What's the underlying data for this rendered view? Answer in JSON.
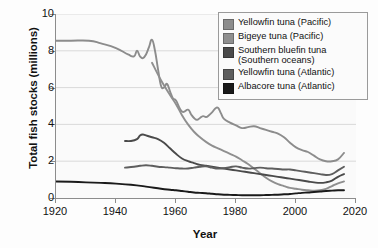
{
  "chart_data": {
    "type": "line",
    "title": "",
    "xlabel": "Year",
    "ylabel": "Total fish stocks (millions)",
    "xlim": [
      1920,
      2020
    ],
    "ylim": [
      0,
      10
    ],
    "xticks": [
      1920,
      1940,
      1960,
      1980,
      2000,
      2020
    ],
    "yticks": [
      0,
      2,
      4,
      6,
      8,
      10
    ],
    "grid": "horizontal",
    "legend_position": "top-right",
    "series": [
      {
        "name": "Yellowfin tuna (Pacific)",
        "color": "#8c8c8c",
        "x": [
          1920,
          1925,
          1931,
          1935,
          1940,
          1944,
          1946,
          1947,
          1948,
          1949,
          1950,
          1951,
          1952,
          1953,
          1954,
          1955,
          1956,
          1957,
          1958,
          1959,
          1960,
          1962,
          1964,
          1965,
          1966,
          1967,
          1968,
          1969,
          1970,
          1971,
          1972,
          1973,
          1974,
          1975,
          1976,
          1978,
          1980,
          1982,
          1984,
          1986,
          1988,
          1990,
          1992,
          1994,
          1996,
          1998,
          2000,
          2002,
          2004,
          2006,
          2008,
          2010,
          2012,
          2014,
          2016
        ],
        "y": [
          8.55,
          8.55,
          8.55,
          8.4,
          8.15,
          7.8,
          7.7,
          8.0,
          7.7,
          7.6,
          7.8,
          8.2,
          8.6,
          8.0,
          7.0,
          6.1,
          6.0,
          6.2,
          5.8,
          5.4,
          5.3,
          4.7,
          4.8,
          4.55,
          4.35,
          4.25,
          4.35,
          4.45,
          4.4,
          4.5,
          4.65,
          4.85,
          4.9,
          4.6,
          4.3,
          4.1,
          3.95,
          3.8,
          3.85,
          3.9,
          3.8,
          3.7,
          3.6,
          3.5,
          3.3,
          3.0,
          2.75,
          2.6,
          2.5,
          2.3,
          2.1,
          2.0,
          2.0,
          2.1,
          2.45
        ]
      },
      {
        "name": "Bigeye tuna (Pacific)",
        "color": "#8f8f8f",
        "x": [
          1952,
          1955,
          1958,
          1960,
          1962,
          1964,
          1966,
          1968,
          1970,
          1972,
          1974,
          1976,
          1978,
          1980,
          1982,
          1984,
          1986,
          1988,
          1990,
          1992,
          1994,
          1996,
          1998,
          2000,
          2002,
          2004,
          2006,
          2008,
          2010,
          2012,
          2014,
          2016
        ],
        "y": [
          7.35,
          6.4,
          5.6,
          5.1,
          4.5,
          4.0,
          3.6,
          3.3,
          3.05,
          2.85,
          2.7,
          2.55,
          2.4,
          2.25,
          2.05,
          1.85,
          1.6,
          1.35,
          1.1,
          0.9,
          0.75,
          0.65,
          0.55,
          0.5,
          0.45,
          0.42,
          0.4,
          0.42,
          0.5,
          0.65,
          0.8,
          0.9
        ]
      },
      {
        "name": "Southern bluefin tuna (Southern oceans)",
        "color": "#4a4a4a",
        "x": [
          1943,
          1945,
          1947,
          1948,
          1949,
          1950,
          1952,
          1954,
          1956,
          1958,
          1960,
          1962,
          1964,
          1966,
          1968,
          1970,
          1972,
          1974,
          1976,
          1978,
          1980,
          1982,
          1984,
          1986,
          1988,
          1990,
          1992,
          1994,
          1996,
          1998,
          2000,
          2002,
          2004,
          2006,
          2008,
          2010,
          2012,
          2014,
          2016
        ],
        "y": [
          3.1,
          3.1,
          3.2,
          3.4,
          3.45,
          3.4,
          3.3,
          3.2,
          3.0,
          2.7,
          2.4,
          2.15,
          2.0,
          1.9,
          1.8,
          1.75,
          1.7,
          1.65,
          1.6,
          1.55,
          1.5,
          1.45,
          1.4,
          1.35,
          1.3,
          1.25,
          1.2,
          1.15,
          1.1,
          1.05,
          1.0,
          0.95,
          0.9,
          0.85,
          0.82,
          0.85,
          0.95,
          1.15,
          1.3
        ]
      },
      {
        "name": "Yellowfin tuna (Atlantic)",
        "color": "#5e5e5e",
        "x": [
          1943,
          1946,
          1948,
          1950,
          1952,
          1954,
          1956,
          1958,
          1960,
          1962,
          1964,
          1966,
          1968,
          1970,
          1972,
          1974,
          1976,
          1978,
          1980,
          1982,
          1984,
          1986,
          1988,
          1990,
          1992,
          1994,
          1996,
          1998,
          2000,
          2002,
          2004,
          2006,
          2008,
          2010,
          2012,
          2014,
          2016
        ],
        "y": [
          1.65,
          1.7,
          1.75,
          1.78,
          1.75,
          1.7,
          1.68,
          1.65,
          1.62,
          1.6,
          1.6,
          1.65,
          1.7,
          1.72,
          1.65,
          1.6,
          1.62,
          1.68,
          1.72,
          1.65,
          1.6,
          1.62,
          1.65,
          1.62,
          1.6,
          1.58,
          1.55,
          1.55,
          1.5,
          1.45,
          1.4,
          1.35,
          1.3,
          1.25,
          1.3,
          1.5,
          1.7
        ]
      },
      {
        "name": "Albacore tuna (Atlantic)",
        "color": "#1a1a1a",
        "x": [
          1920,
          1925,
          1930,
          1935,
          1940,
          1945,
          1950,
          1955,
          1958,
          1960,
          1962,
          1964,
          1966,
          1968,
          1970,
          1972,
          1974,
          1976,
          1978,
          1980,
          1982,
          1984,
          1986,
          1988,
          1990,
          1992,
          1994,
          1996,
          1998,
          2000,
          2002,
          2004,
          2006,
          2008,
          2010,
          2012,
          2014,
          2016
        ],
        "y": [
          0.9,
          0.88,
          0.85,
          0.82,
          0.78,
          0.72,
          0.62,
          0.5,
          0.45,
          0.42,
          0.38,
          0.34,
          0.3,
          0.28,
          0.26,
          0.23,
          0.2,
          0.18,
          0.17,
          0.16,
          0.15,
          0.15,
          0.15,
          0.15,
          0.16,
          0.17,
          0.18,
          0.2,
          0.22,
          0.25,
          0.28,
          0.3,
          0.33,
          0.35,
          0.38,
          0.4,
          0.42,
          0.42
        ]
      }
    ]
  },
  "axes": {
    "ylabel": "Total fish stocks (millions)",
    "xlabel": "Year",
    "yticks": [
      "10",
      "8",
      "6",
      "4",
      "2",
      "0"
    ],
    "xticks": [
      "1920",
      "1940",
      "1960",
      "1980",
      "2000",
      "2020"
    ]
  },
  "legend": {
    "items": [
      {
        "label": "Yellowfin tuna (Pacific)",
        "color": "#8c8c8c"
      },
      {
        "label": "Bigeye tuna (Pacific)",
        "color": "#8f8f8f"
      },
      {
        "label": "Southern bluefin tuna\n(Southern oceans)",
        "color": "#4a4a4a"
      },
      {
        "label": "Yellowfin tuna (Atlantic)",
        "color": "#5e5e5e"
      },
      {
        "label": "Albacore tuna (Atlantic)",
        "color": "#1a1a1a"
      }
    ]
  }
}
